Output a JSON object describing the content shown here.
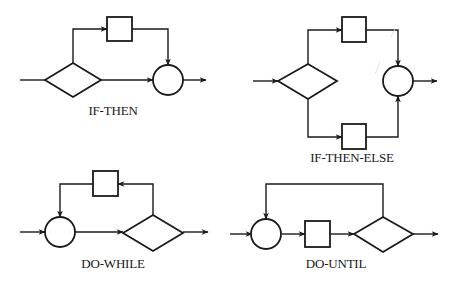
{
  "figure": {
    "background": "#ffffff",
    "ink_color": "#1a1a1a",
    "panels": [
      {
        "id": "if-then",
        "label": "IF-THEN",
        "nodes": [
          "input",
          "decision-diamond",
          "process-box",
          "junction-circle",
          "output"
        ],
        "edges": [
          {
            "from": "input",
            "to": "decision-diamond",
            "arrow": false
          },
          {
            "from": "decision-diamond",
            "to": "process-box",
            "path": "up-then-right",
            "arrow": true
          },
          {
            "from": "process-box",
            "to": "junction-circle",
            "path": "right-then-down",
            "arrow": true
          },
          {
            "from": "decision-diamond",
            "to": "junction-circle",
            "path": "straight",
            "arrow": true
          },
          {
            "from": "junction-circle",
            "to": "output",
            "arrow": true
          }
        ]
      },
      {
        "id": "if-then-else",
        "label": "IF-THEN-ELSE",
        "nodes": [
          "input",
          "decision-diamond",
          "then-box",
          "else-box",
          "junction-circle",
          "output"
        ],
        "edges": [
          {
            "from": "input",
            "to": "decision-diamond",
            "arrow": true
          },
          {
            "from": "decision-diamond",
            "to": "then-box",
            "path": "up-then-right",
            "arrow": true
          },
          {
            "from": "decision-diamond",
            "to": "else-box",
            "path": "down-then-right",
            "arrow": true
          },
          {
            "from": "then-box",
            "to": "junction-circle",
            "path": "right-then-down",
            "arrow": true
          },
          {
            "from": "else-box",
            "to": "junction-circle",
            "path": "right-then-up",
            "arrow": true
          },
          {
            "from": "junction-circle",
            "to": "output",
            "arrow": true
          }
        ]
      },
      {
        "id": "do-while",
        "label": "DO-WHILE",
        "nodes": [
          "input",
          "junction-circle",
          "decision-diamond",
          "loop-box",
          "output"
        ],
        "edges": [
          {
            "from": "input",
            "to": "junction-circle",
            "arrow": true
          },
          {
            "from": "junction-circle",
            "to": "decision-diamond",
            "arrow": true
          },
          {
            "from": "decision-diamond",
            "to": "loop-box",
            "path": "up-then-left",
            "arrow": true
          },
          {
            "from": "loop-box",
            "to": "junction-circle",
            "path": "left-then-down",
            "arrow": true
          },
          {
            "from": "decision-diamond",
            "to": "output",
            "arrow": true
          }
        ]
      },
      {
        "id": "do-until",
        "label": "DO-UNTIL",
        "nodes": [
          "input",
          "junction-circle",
          "process-box",
          "decision-diamond",
          "output"
        ],
        "edges": [
          {
            "from": "input",
            "to": "junction-circle",
            "arrow": true
          },
          {
            "from": "junction-circle",
            "to": "process-box",
            "arrow": true
          },
          {
            "from": "process-box",
            "to": "decision-diamond",
            "arrow": true
          },
          {
            "from": "decision-diamond",
            "to": "junction-circle",
            "path": "up-left-down",
            "arrow": true
          },
          {
            "from": "decision-diamond",
            "to": "output",
            "arrow": true
          }
        ]
      }
    ]
  }
}
